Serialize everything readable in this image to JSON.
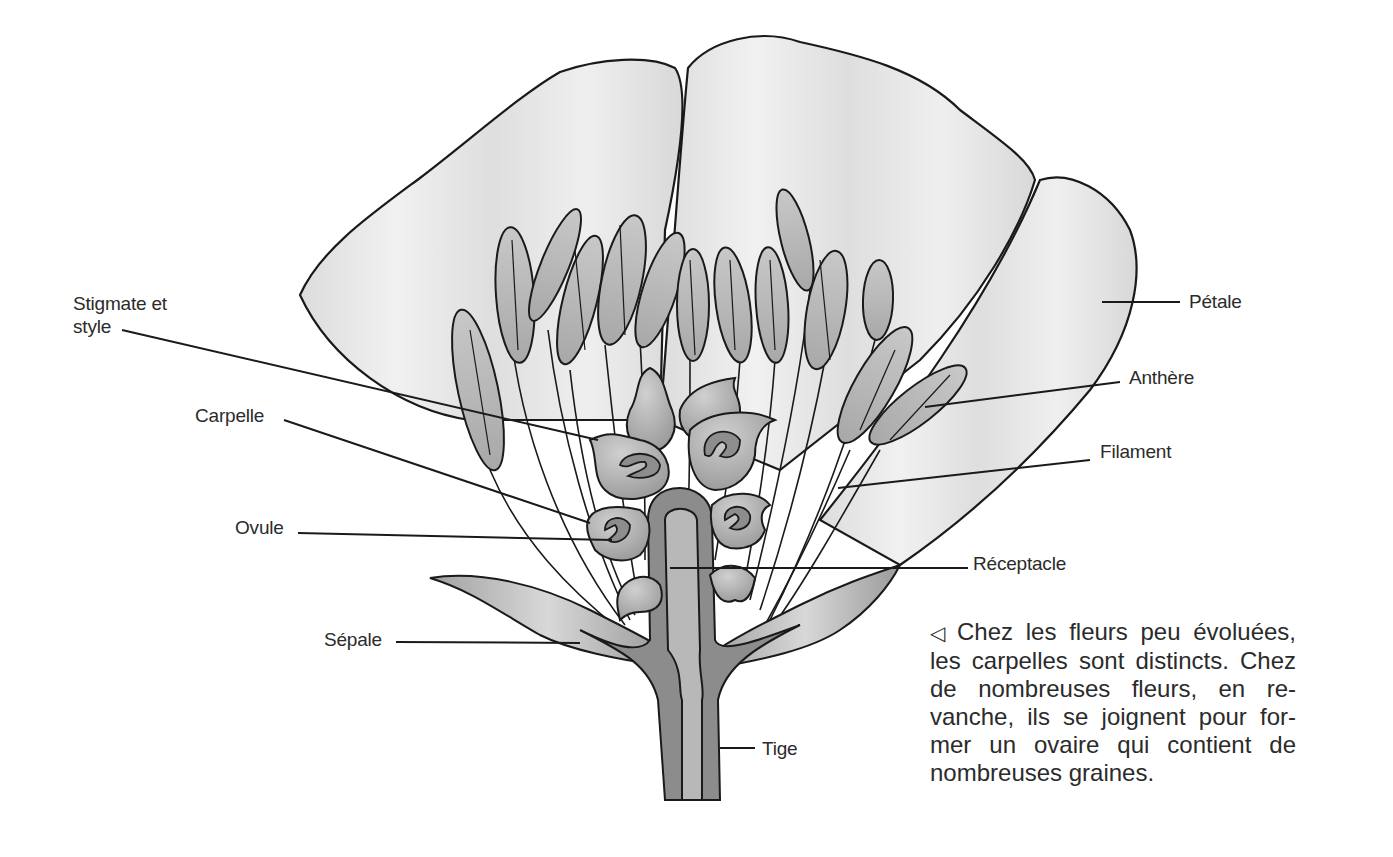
{
  "diagram": {
    "labels": {
      "stigmate": "Stigmate et\nstyle",
      "stigmate_l1": "Stigmate et",
      "stigmate_l2": "style",
      "carpelle": "Carpelle",
      "ovule": "Ovule",
      "sepale": "Sépale",
      "petale": "Pétale",
      "anthere": "Anthère",
      "filament": "Filament",
      "receptacle": "Réceptacle",
      "tige": "Tige"
    },
    "caption": {
      "marker": "◁",
      "lines": [
        "Chez les fleurs peu évoluées,",
        "les carpelles sont distincts. Chez",
        "de nombreuses fleurs, en re-",
        "vanche, ils se joignent pour for-",
        "mer un ovaire qui contient de",
        "nombreuses graines."
      ]
    },
    "colors": {
      "outline": "#1a1a1a",
      "petal_fill": "#e6e6e6",
      "anther_fill": "#b9b9b9",
      "carpel_fill": "#a9a9a9",
      "stem_dark": "#8a8a8a",
      "stem_light": "#b5b5b5"
    }
  }
}
